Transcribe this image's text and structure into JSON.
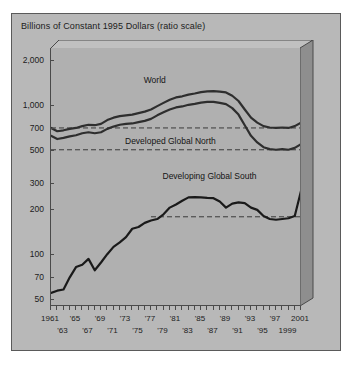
{
  "chart_data": {
    "type": "line",
    "title": "Billions of Constant 1995 Dollars (ratio scale)",
    "xlabel": "",
    "ylabel": "",
    "scale": "log",
    "grid": false,
    "legend_position": "inline-annotations",
    "ylim": [
      45,
      2400
    ],
    "xlim": [
      1961,
      2001
    ],
    "ytick_labels": [
      "2,000",
      "1,000",
      "700",
      "500",
      "300",
      "200",
      "100",
      "70",
      "50"
    ],
    "ytick_values": [
      2000,
      1000,
      700,
      500,
      300,
      200,
      100,
      70,
      50
    ],
    "xtick_labels_top": [
      "1961",
      "'65",
      "'69",
      "'73",
      "'77",
      "'81",
      "'85",
      "'89",
      "'93",
      "'97",
      "2001"
    ],
    "xtick_values_top": [
      1961,
      1965,
      1969,
      1973,
      1977,
      1981,
      1985,
      1989,
      1993,
      1997,
      2001
    ],
    "xtick_labels_bottom": [
      "'63",
      "'67",
      "'71",
      "'75",
      "'79",
      "'83",
      "'87",
      "'91",
      "'95",
      "1999"
    ],
    "xtick_values_bottom": [
      1963,
      1967,
      1971,
      1975,
      1979,
      1983,
      1987,
      1991,
      1995,
      1999
    ],
    "x": [
      1961,
      1962,
      1963,
      1964,
      1965,
      1966,
      1967,
      1968,
      1969,
      1970,
      1971,
      1972,
      1973,
      1974,
      1975,
      1976,
      1977,
      1978,
      1979,
      1980,
      1981,
      1982,
      1983,
      1984,
      1985,
      1986,
      1987,
      1988,
      1989,
      1990,
      1991,
      1992,
      1993,
      1994,
      1995,
      1996,
      1997,
      1998,
      1999,
      2000,
      2001
    ],
    "series": [
      {
        "name": "World",
        "color": "#2e2e2e",
        "values": [
          700,
          665,
          675,
          690,
          700,
          720,
          735,
          730,
          745,
          790,
          820,
          840,
          850,
          860,
          880,
          900,
          930,
          980,
          1030,
          1080,
          1120,
          1140,
          1170,
          1190,
          1215,
          1230,
          1235,
          1225,
          1210,
          1150,
          1060,
          930,
          820,
          760,
          720,
          705,
          700,
          705,
          700,
          720,
          760
        ]
      },
      {
        "name": "Developed Global North",
        "color": "#2e2e2e",
        "values": [
          620,
          590,
          600,
          615,
          625,
          645,
          655,
          645,
          655,
          690,
          715,
          735,
          745,
          750,
          765,
          780,
          805,
          850,
          890,
          930,
          960,
          975,
          1000,
          1015,
          1035,
          1045,
          1045,
          1030,
          1010,
          950,
          860,
          730,
          620,
          560,
          520,
          505,
          500,
          505,
          500,
          515,
          545
        ]
      },
      {
        "name": "Developing Global South",
        "color": "#1a1a1a",
        "values": [
          55,
          57,
          58,
          70,
          82,
          85,
          93,
          78,
          88,
          100,
          112,
          120,
          130,
          148,
          152,
          162,
          168,
          172,
          185,
          205,
          215,
          228,
          240,
          241,
          240,
          238,
          237,
          225,
          205,
          218,
          222,
          220,
          205,
          198,
          180,
          172,
          170,
          172,
          174,
          180,
          265
        ]
      }
    ],
    "reference_lines": [
      {
        "name": "north-upper-ref",
        "value": 700,
        "style": "dashed",
        "x_start": 1961,
        "x_end": 2001
      },
      {
        "name": "north-lower-ref",
        "value": 500,
        "style": "dashed",
        "x_start": 1961,
        "x_end": 2001
      },
      {
        "name": "south-ref",
        "value": 178,
        "style": "dashed",
        "x_start": 1977,
        "x_end": 2001
      }
    ],
    "annotations": [
      {
        "text": "World",
        "x": 1976,
        "y": 1450,
        "name": "series-label-world"
      },
      {
        "text": "Developed Global North",
        "x": 1973,
        "y": 560,
        "name": "series-label-developed-global-north"
      },
      {
        "text": "Developing Global South",
        "x": 1979,
        "y": 330,
        "name": "series-label-developing-global-south"
      }
    ]
  },
  "colors": {
    "panel": "#b8b8b8",
    "plot_bg": "#b0b0b0",
    "box_shade": "#8e8e8e",
    "axis": "#4a4a4a",
    "line": "#2e2e2e",
    "text": "#1c1c1c"
  }
}
